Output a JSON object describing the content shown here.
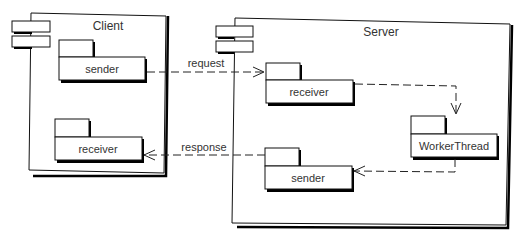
{
  "diagram": {
    "type": "UML component diagram",
    "components": [
      {
        "id": "client",
        "label": "Client",
        "packages": [
          {
            "id": "client-sender",
            "label": "sender"
          },
          {
            "id": "client-receiver",
            "label": "receiver"
          }
        ]
      },
      {
        "id": "server",
        "label": "Server",
        "packages": [
          {
            "id": "server-receiver",
            "label": "receiver"
          },
          {
            "id": "server-workerthread",
            "label": "WorkerThread"
          },
          {
            "id": "server-sender",
            "label": "sender"
          }
        ]
      }
    ],
    "connections": [
      {
        "from": "client-sender",
        "to": "server-receiver",
        "label": "request",
        "style": "dashed",
        "arrow": "open"
      },
      {
        "from": "server-receiver",
        "to": "server-workerthread",
        "label": "",
        "style": "dashed",
        "arrow": "open"
      },
      {
        "from": "server-workerthread",
        "to": "server-sender",
        "label": "",
        "style": "dashed",
        "arrow": "open"
      },
      {
        "from": "server-sender",
        "to": "client-receiver",
        "label": "response",
        "style": "dashed",
        "arrow": "open"
      }
    ],
    "colors": {
      "line": "#111111",
      "text": "#333333",
      "background": "#ffffff"
    }
  }
}
